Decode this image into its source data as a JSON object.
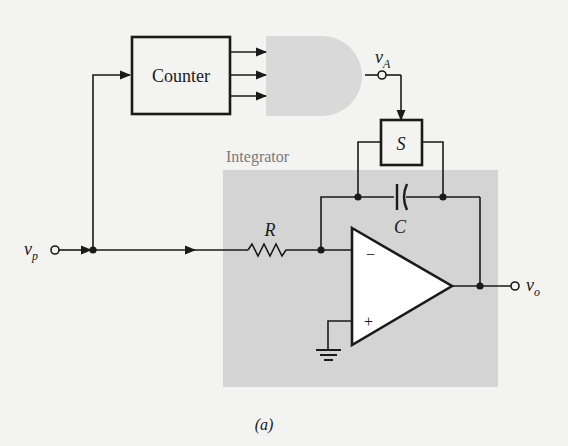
{
  "figure": {
    "caption": "(a)",
    "colors": {
      "background": "#f3f3f1",
      "integrator_shade": "#d4d4d4",
      "gate_shade": "#d9d9d9",
      "line": "#1a1a1a"
    }
  },
  "blocks": {
    "counter": {
      "label": "Counter"
    },
    "gate": {
      "label": ""
    },
    "switch": {
      "label": "S"
    },
    "integrator": {
      "label": "Integrator"
    }
  },
  "components": {
    "resistor": {
      "label": "R"
    },
    "capacitor": {
      "label": "C"
    },
    "opamp": {
      "inverting_symbol": "−",
      "noninverting_symbol": "+"
    }
  },
  "signals": {
    "input": {
      "symbol": "v",
      "subscript": "p"
    },
    "gate_output": {
      "symbol": "v",
      "subscript": "A"
    },
    "output": {
      "symbol": "v",
      "subscript": "o"
    }
  }
}
